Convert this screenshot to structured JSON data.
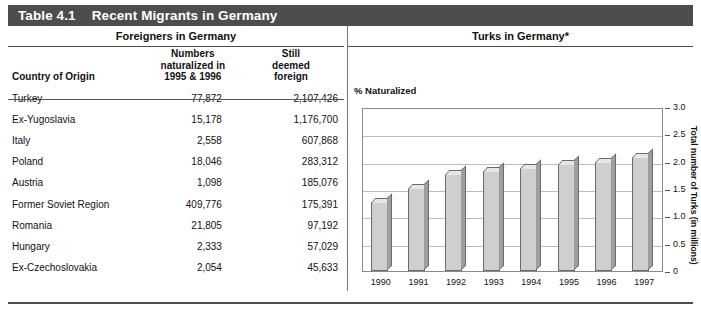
{
  "title": {
    "number": "Table 4.1",
    "text": "Recent Migrants in Germany"
  },
  "panels": {
    "left_header": "Foreigners in Germany",
    "right_header": "Turks in Germany*"
  },
  "table": {
    "columns": [
      "Country of Origin",
      "Numbers\nnaturalized in\n1995 & 1996",
      "Still\ndeemed\nforeign"
    ],
    "col1_header": "Country of Origin",
    "col2_header_line1": "Numbers",
    "col2_header_line2": "naturalized in",
    "col2_header_line3": "1995 & 1996",
    "col3_header_line1": "Still",
    "col3_header_line2": "deemed",
    "col3_header_line3": "foreign",
    "rows": [
      {
        "country": "Turkey",
        "naturalized": "77,872",
        "foreign": "2,107,426"
      },
      {
        "country": "Ex-Yugoslavia",
        "naturalized": "15,178",
        "foreign": "1,176,700"
      },
      {
        "country": "Italy",
        "naturalized": "2,558",
        "foreign": "607,868"
      },
      {
        "country": "Poland",
        "naturalized": "18,046",
        "foreign": "283,312"
      },
      {
        "country": "Austria",
        "naturalized": "1,098",
        "foreign": "185,076"
      },
      {
        "country": "Former Soviet Region",
        "naturalized": "409,776",
        "foreign": "175,391"
      },
      {
        "country": "Romania",
        "naturalized": "21,805",
        "foreign": "97,192"
      },
      {
        "country": "Hungary",
        "naturalized": "2,333",
        "foreign": "57,029"
      },
      {
        "country": "Ex-Czechoslovakia",
        "naturalized": "2,054",
        "foreign": "45,633"
      }
    ]
  },
  "chart_data": {
    "type": "bar",
    "title": "Turks in Germany*",
    "annotation": "% Naturalized",
    "xlabel": "",
    "ylabel": "Total number of Turks (in millions)",
    "categories": [
      "1990",
      "1991",
      "1992",
      "1993",
      "1994",
      "1995",
      "1996",
      "1997"
    ],
    "values": [
      1.26,
      1.52,
      1.78,
      1.83,
      1.88,
      1.95,
      2.0,
      2.09
    ],
    "ylim": [
      0,
      3.0
    ],
    "yticks": [
      "0",
      "0.5",
      "1.0",
      "1.5",
      "2.0",
      "2.5",
      "3.0"
    ],
    "ytick_values": [
      0,
      0.5,
      1.0,
      1.5,
      2.0,
      2.5,
      3.0
    ],
    "grid": true,
    "legend": "none"
  },
  "colors": {
    "title_bar": "#4d4d4d",
    "title_text": "#ffffff",
    "bar_face": "#cfcfcf",
    "bar_top": "#e6e6e6",
    "bar_side": "#9e9e9e",
    "bar_outline": "#6b6b6b",
    "gridline": "#bdbdbd",
    "rule": "#4d4d4d"
  }
}
